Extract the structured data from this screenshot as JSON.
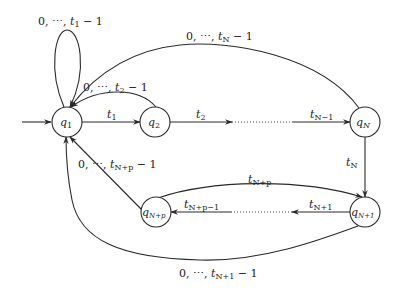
{
  "diagram": {
    "type": "finite-state-automaton",
    "nodes": [
      {
        "id": "q1",
        "label": "q1",
        "cx": 67,
        "cy": 122
      },
      {
        "id": "q2",
        "label": "q2",
        "cx": 155,
        "cy": 122
      },
      {
        "id": "qN",
        "label": "qN",
        "cx": 365,
        "cy": 122
      },
      {
        "id": "qN1",
        "label": "qN+1",
        "cx": 365,
        "cy": 212
      },
      {
        "id": "qNp",
        "label": "qN+p",
        "cx": 156,
        "cy": 212
      }
    ],
    "edges": {
      "self_loop_q1": "0, ⋯, t1 − 1",
      "q1_to_q2": "t1",
      "q2_to_q1": "0, ⋯, t2 − 1",
      "q2_to_next": "t2",
      "prev_to_qN": "tN−1",
      "qN_to_q1": "0, ⋯, tN − 1",
      "qN_to_qN1": "tN",
      "qN1_to_next": "tN+1",
      "prev_to_qNp": "tN+p−1",
      "qNp_to_qN1": "tN+p",
      "qNp_to_q1": "0, ⋯, tN+p − 1",
      "qN1_to_q1": "0, ⋯, tN+1 − 1"
    }
  }
}
